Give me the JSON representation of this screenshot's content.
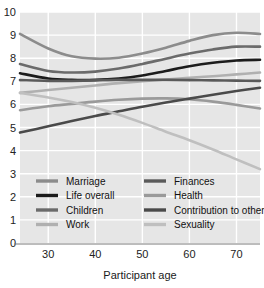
{
  "chart_data": {
    "type": "line",
    "title": "",
    "xlabel": "Participant age",
    "ylabel": "",
    "xlim": [
      24,
      75
    ],
    "ylim": [
      0,
      10
    ],
    "xticks": [
      30,
      40,
      50,
      60,
      70
    ],
    "yticks": [
      0,
      1,
      2,
      3,
      4,
      5,
      6,
      7,
      8,
      9,
      10
    ],
    "grid": true,
    "legend_position": "inside-bottom-left",
    "x": [
      24,
      30,
      35,
      40,
      45,
      50,
      55,
      60,
      65,
      70,
      75
    ],
    "series": [
      {
        "name": "Marriage",
        "color": "#8c8c8c",
        "values": [
          9.05,
          8.42,
          8.08,
          7.98,
          8.02,
          8.2,
          8.45,
          8.75,
          9.0,
          9.1,
          9.05
        ]
      },
      {
        "name": "Life overall",
        "color": "#1c1c1c",
        "values": [
          7.35,
          7.12,
          7.06,
          7.06,
          7.12,
          7.25,
          7.45,
          7.65,
          7.8,
          7.9,
          7.93
        ]
      },
      {
        "name": "Children",
        "color": "#6b6b6b",
        "values": [
          7.75,
          7.45,
          7.38,
          7.42,
          7.55,
          7.75,
          7.98,
          8.2,
          8.38,
          8.5,
          8.5
        ]
      },
      {
        "name": "Work",
        "color": "#b0b0b0",
        "values": [
          6.5,
          6.62,
          6.72,
          6.82,
          6.92,
          7.0,
          7.08,
          7.15,
          7.22,
          7.3,
          7.38
        ]
      },
      {
        "name": "Finances",
        "color": "#5a5a5a",
        "values": [
          7.05,
          7.02,
          7.02,
          7.04,
          7.06,
          7.06,
          7.06,
          7.05,
          7.04,
          7.03,
          7.02
        ]
      },
      {
        "name": "Health",
        "color": "#9a9a9a",
        "values": [
          5.75,
          5.92,
          6.02,
          6.12,
          6.2,
          6.25,
          6.26,
          6.22,
          6.12,
          5.98,
          5.82
        ]
      },
      {
        "name": "Contribution to others",
        "color": "#4a4a4a",
        "values": [
          4.78,
          5.05,
          5.28,
          5.5,
          5.7,
          5.9,
          6.08,
          6.25,
          6.42,
          6.58,
          6.72
        ]
      },
      {
        "name": "Sexuality",
        "color": "#bfbfbf",
        "values": [
          6.5,
          6.3,
          6.1,
          5.85,
          5.55,
          5.2,
          4.82,
          4.45,
          4.05,
          3.62,
          3.2
        ]
      }
    ]
  },
  "legend": {
    "columns": [
      [
        {
          "label": "Marriage",
          "color": "#8c8c8c"
        },
        {
          "label": "Life overall",
          "color": "#1c1c1c"
        },
        {
          "label": "Children",
          "color": "#6b6b6b"
        },
        {
          "label": "Work",
          "color": "#b0b0b0"
        }
      ],
      [
        {
          "label": "Finances",
          "color": "#5a5a5a"
        },
        {
          "label": "Health",
          "color": "#9a9a9a"
        },
        {
          "label": "Contribution to others",
          "color": "#4a4a4a"
        },
        {
          "label": "Sexuality",
          "color": "#bfbfbf"
        }
      ]
    ]
  },
  "styling": {
    "plot_background": "#e6e6e6",
    "gridline_color": "#ffffff",
    "axis_color": "#7a7a7a",
    "page_background": "#ffffff"
  },
  "cropped_header": {
    "text": ""
  }
}
